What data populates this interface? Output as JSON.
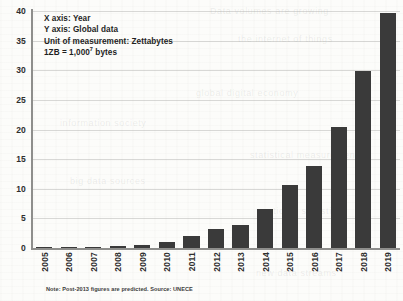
{
  "chart_data": {
    "type": "bar",
    "title": "",
    "xlabel": "Year",
    "ylabel": "Global data",
    "categories": [
      "2005",
      "2006",
      "2007",
      "2008",
      "2009",
      "2010",
      "2011",
      "2012",
      "2013",
      "2014",
      "2015",
      "2016",
      "2017",
      "2018",
      "2019"
    ],
    "values": [
      0.13,
      0.16,
      0.2,
      0.28,
      0.5,
      1.0,
      2.0,
      3.2,
      3.9,
      6.6,
      10.7,
      13.9,
      20.4,
      29.9,
      39.7
    ],
    "ylim": [
      0,
      40
    ],
    "yticks": [
      0,
      5,
      10,
      15,
      20,
      25,
      30,
      35,
      40
    ],
    "ytick_labels": [
      "0",
      "5",
      "10",
      "15",
      "20",
      "25",
      "30",
      "35",
      "40"
    ],
    "grid": true,
    "legend": "none",
    "bar_color": "#3a3a3a",
    "axis_color": "#8e8e8c",
    "grid_color": "#a8a8a5",
    "background_color": "#fcfcfa"
  },
  "annotation": {
    "line_x_axis": "X axis: Year",
    "line_y_axis": "Y axis: Global data",
    "line_unit": "Unit of measurement: Zettabytes",
    "line_conversion_prefix": "1ZB = 1,000",
    "line_conversion_exponent": "7",
    "line_conversion_suffix": " bytes"
  },
  "note": "Note: Post-2013 figures are predicted. Source: UNECE",
  "ghost_text": {
    "a": "Data volumes are growing",
    "b": "the internet of things",
    "c": "global digital economy",
    "d": "information society",
    "e": "statistical measurement",
    "f": "big data sources",
    "g": "national statistics",
    "h": "new data streams"
  }
}
